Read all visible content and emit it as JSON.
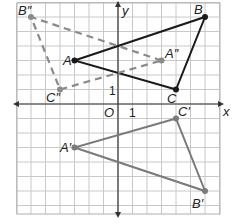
{
  "diagram": {
    "type": "coordinate-plane-transformations",
    "grid": {
      "x_min": -7,
      "x_max": 7,
      "y_min": -7.5,
      "y_max": 7,
      "unit_px": 14.5,
      "origin_px": [
        118,
        104
      ],
      "left_px": 17,
      "top_px": 3,
      "right_px": 220,
      "bottom_px": 214,
      "grid_color": "#c8c8c8",
      "border_color": "#b0b0b0"
    },
    "axes": {
      "x_label": "x",
      "y_label": "y",
      "origin_label": "O",
      "x_tick_label": "1",
      "y_tick_label": "1",
      "color": "#333333"
    },
    "triangles": [
      {
        "name": "ABC",
        "style": "solid",
        "color": "#1a1a1a",
        "vertices": [
          {
            "label": "A",
            "x": -3,
            "y": 3
          },
          {
            "label": "B",
            "x": 6,
            "y": 6
          },
          {
            "label": "C",
            "x": 4,
            "y": 1
          }
        ]
      },
      {
        "name": "A'B'C'",
        "style": "solid",
        "color": "#7a7a7a",
        "vertices": [
          {
            "label": "A'",
            "x": -3,
            "y": -3
          },
          {
            "label": "B'",
            "x": 6,
            "y": -6
          },
          {
            "label": "C'",
            "x": 4,
            "y": -1
          }
        ]
      },
      {
        "name": "A''B''C''",
        "style": "dashed",
        "color": "#8a8a8a",
        "vertices": [
          {
            "label": "A''",
            "x": 3,
            "y": 3
          },
          {
            "label": "B''",
            "x": -6,
            "y": 6
          },
          {
            "label": "C''",
            "x": -4,
            "y": 1
          }
        ]
      }
    ],
    "labels": {
      "A": "A",
      "B": "B",
      "C": "C",
      "A1": "A′",
      "B1": "B′",
      "C1": "C′",
      "A2": "A″",
      "B2": "B″",
      "C2": "C″"
    }
  }
}
